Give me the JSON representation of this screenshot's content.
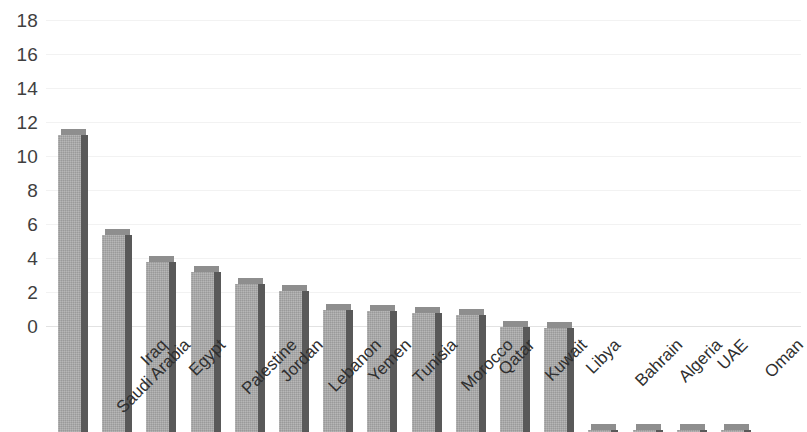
{
  "chart_data": {
    "type": "bar",
    "title": "",
    "subtitle": "",
    "xlabel": "",
    "ylabel": "",
    "categories": [
      "Saudi Arabia",
      "Iraq",
      "Egypt",
      "Palestine",
      "Jordan",
      "Lebanon",
      "Yemen",
      "Tunisia",
      "Morocco",
      "Qatar",
      "Kuwait",
      "Libya",
      "Bahrain",
      "Algeria",
      "UAE",
      "Oman"
    ],
    "values": [
      17.5,
      11.6,
      10.0,
      9.4,
      8.7,
      8.3,
      7.2,
      7.1,
      7.0,
      6.9,
      6.2,
      6.1,
      0.1,
      0.1,
      0.1,
      0.1
    ],
    "ylim": [
      0,
      18
    ],
    "y_tick_step": 2,
    "y_tick_labels": [
      "18",
      "16",
      "14",
      "12",
      "10",
      "8",
      "6",
      "4",
      "2",
      "0"
    ],
    "y_tick_values": [
      18,
      16,
      14,
      12,
      10,
      8,
      6,
      4,
      2,
      0
    ],
    "grid": true,
    "grid_axis": "y",
    "legend": false,
    "legend_position": "none",
    "bar_style": "3d",
    "colors": {
      "bar_front": "#a9a9a9",
      "bar_side": "#595959",
      "bar_top": "#8e8e8e",
      "gridline": "#f2f2f2",
      "axis_text": "#3f3f3f",
      "background": "#ffffff"
    }
  }
}
